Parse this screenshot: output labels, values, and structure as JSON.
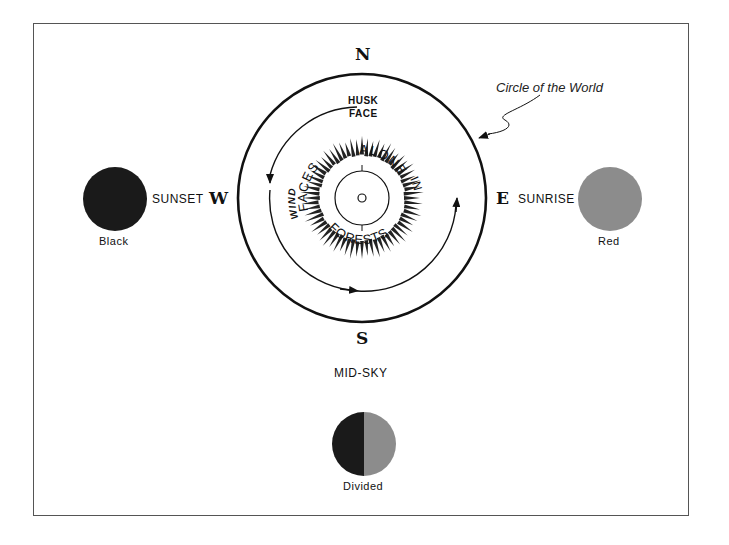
{
  "diagram": {
    "title_annotation": "Circle of the World",
    "directions": {
      "north": "N",
      "south": "S",
      "east": "E",
      "west": "W"
    },
    "sides": {
      "west": {
        "label": "SUNSET",
        "color_name": "Black",
        "color": "#1a1a1a"
      },
      "east": {
        "label": "SUNRISE",
        "color_name": "Red",
        "color": "#8c8c8c"
      },
      "south": {
        "label": "MID-SKY",
        "color_name": "Divided",
        "colors": [
          "#1a1a1a",
          "#8c8c8c"
        ]
      }
    },
    "inner_labels": {
      "top": "HUSK FACE",
      "top_line1": "HUSK",
      "top_line2": "FACE",
      "ring_words": [
        "FACES",
        "ALONE",
        "IN",
        "FORESTS",
        "WIND"
      ]
    }
  }
}
